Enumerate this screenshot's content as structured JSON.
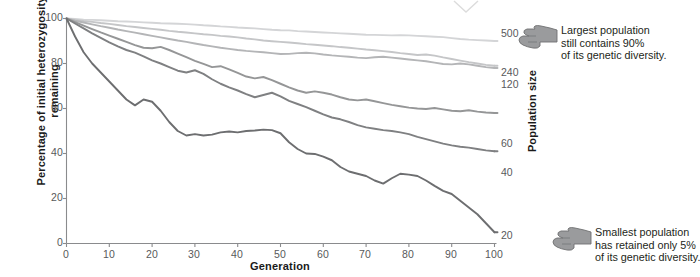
{
  "chart_data": {
    "type": "line",
    "title": "",
    "xlabel": "Generation",
    "ylabel": "Percentage of initial heterozygosity remaining",
    "right_axis_label": "Population size",
    "xlim": [
      0,
      100
    ],
    "ylim": [
      0,
      100
    ],
    "x_ticks": [
      "0",
      "10",
      "20",
      "30",
      "40",
      "50",
      "60",
      "70",
      "80",
      "90",
      "100"
    ],
    "y_ticks": [
      "0",
      "20",
      "40",
      "60",
      "80",
      "100"
    ],
    "grid": false,
    "legend_position": "right-end-labels",
    "series": [
      {
        "name": "500",
        "label": "500",
        "color": "#d4d5d7",
        "end_value": 90,
        "x": [
          0,
          2,
          4,
          6,
          8,
          10,
          12,
          14,
          16,
          18,
          20,
          22,
          24,
          26,
          28,
          30,
          32,
          34,
          36,
          38,
          40,
          42,
          44,
          46,
          48,
          50,
          52,
          54,
          56,
          58,
          60,
          62,
          64,
          66,
          68,
          70,
          72,
          74,
          76,
          78,
          80,
          82,
          84,
          86,
          88,
          90,
          92,
          94,
          96,
          98,
          100
        ],
        "values": [
          100,
          99.8,
          99.5,
          99.4,
          99.2,
          99.0,
          98.8,
          98.7,
          98.5,
          98.3,
          98.1,
          97.9,
          97.8,
          97.7,
          97.5,
          97.3,
          97.0,
          96.8,
          96.5,
          96.3,
          96.0,
          95.8,
          95.6,
          95.3,
          95.0,
          94.8,
          94.7,
          94.4,
          94.2,
          94.0,
          93.8,
          93.6,
          93.4,
          93.2,
          93.0,
          92.8,
          92.7,
          92.6,
          92.5,
          92.6,
          92.5,
          92.3,
          92.1,
          91.9,
          91.7,
          91.3,
          90.9,
          90.6,
          90.4,
          90.2,
          90.0
        ]
      },
      {
        "name": "240",
        "label": "240",
        "color": "#c5c6c8",
        "end_value": 79,
        "x": [
          0,
          2,
          4,
          6,
          8,
          10,
          12,
          14,
          16,
          18,
          20,
          22,
          24,
          26,
          28,
          30,
          32,
          34,
          36,
          38,
          40,
          42,
          44,
          46,
          48,
          50,
          52,
          54,
          56,
          58,
          60,
          62,
          64,
          66,
          68,
          70,
          72,
          74,
          76,
          78,
          80,
          82,
          84,
          86,
          88,
          90,
          92,
          94,
          96,
          98,
          100
        ],
        "values": [
          100,
          99.4,
          98.9,
          98.5,
          98.0,
          97.6,
          97.1,
          96.6,
          96.2,
          95.8,
          95.4,
          95.0,
          94.5,
          94.1,
          93.8,
          93.4,
          93.0,
          92.7,
          92.3,
          92.0,
          91.6,
          91.1,
          90.7,
          90.2,
          89.9,
          89.6,
          89.3,
          89.0,
          88.6,
          88.3,
          88.0,
          87.7,
          87.3,
          87.0,
          86.6,
          86.2,
          85.9,
          85.5,
          85.1,
          84.6,
          84.2,
          83.8,
          84.0,
          83.5,
          82.7,
          82.0,
          81.3,
          80.6,
          80.0,
          79.4,
          79.0
        ]
      },
      {
        "name": "120",
        "label": "120",
        "color": "#b4b5b7",
        "end_value": 78,
        "x": [
          0,
          2,
          4,
          6,
          8,
          10,
          12,
          14,
          16,
          18,
          20,
          22,
          24,
          26,
          28,
          30,
          32,
          34,
          36,
          38,
          40,
          42,
          44,
          46,
          48,
          50,
          52,
          54,
          56,
          58,
          60,
          62,
          64,
          66,
          68,
          70,
          72,
          74,
          76,
          78,
          80,
          82,
          84,
          86,
          88,
          90,
          92,
          94,
          96,
          98,
          100
        ],
        "values": [
          100,
          99.0,
          98.2,
          97.4,
          96.6,
          95.9,
          95.1,
          94.4,
          93.7,
          93.0,
          92.3,
          91.6,
          90.9,
          90.2,
          89.6,
          88.9,
          88.2,
          87.6,
          87.0,
          86.5,
          86.0,
          85.6,
          85.3,
          85.0,
          84.6,
          84.2,
          84.3,
          84.6,
          84.8,
          84.5,
          84.0,
          83.6,
          83.3,
          83.0,
          82.6,
          82.4,
          82.8,
          83.0,
          82.6,
          82.2,
          81.8,
          81.4,
          81.0,
          80.4,
          79.8,
          79.6,
          80.0,
          79.6,
          79.0,
          78.4,
          78.0
        ]
      },
      {
        "name": "60",
        "label": "60",
        "color": "#959697",
        "end_value": 58,
        "x": [
          0,
          2,
          4,
          6,
          8,
          10,
          12,
          14,
          16,
          18,
          20,
          22,
          24,
          26,
          28,
          30,
          32,
          34,
          36,
          38,
          40,
          42,
          44,
          46,
          48,
          50,
          52,
          54,
          56,
          58,
          60,
          62,
          64,
          66,
          68,
          70,
          72,
          74,
          76,
          78,
          80,
          82,
          84,
          86,
          88,
          90,
          92,
          94,
          96,
          98,
          100
        ],
        "values": [
          100,
          98.4,
          96.8,
          95.3,
          93.8,
          92.4,
          91.0,
          89.6,
          88.2,
          87.0,
          86.8,
          87.4,
          86.0,
          84.4,
          82.8,
          81.2,
          79.8,
          78.4,
          78.8,
          77.4,
          75.8,
          74.2,
          73.4,
          74.0,
          72.6,
          71.0,
          69.4,
          68.0,
          67.0,
          67.6,
          67.0,
          66.2,
          65.0,
          64.0,
          63.6,
          64.0,
          63.2,
          62.4,
          61.6,
          61.0,
          60.4,
          60.0,
          59.8,
          60.2,
          59.6,
          59.0,
          58.8,
          59.2,
          58.6,
          58.2,
          58.0
        ]
      },
      {
        "name": "40",
        "label": "40",
        "color": "#7f8082",
        "end_value": 41,
        "x": [
          0,
          2,
          4,
          6,
          8,
          10,
          12,
          14,
          16,
          18,
          20,
          22,
          24,
          26,
          28,
          30,
          32,
          34,
          36,
          38,
          40,
          42,
          44,
          46,
          48,
          50,
          52,
          54,
          56,
          58,
          60,
          62,
          64,
          66,
          68,
          70,
          72,
          74,
          76,
          78,
          80,
          82,
          84,
          86,
          88,
          90,
          92,
          94,
          96,
          98,
          100
        ],
        "values": [
          100,
          97.8,
          95.6,
          93.4,
          91.4,
          89.4,
          87.6,
          86.0,
          84.8,
          83.2,
          81.4,
          80.0,
          78.4,
          76.8,
          76.0,
          77.0,
          75.4,
          73.0,
          71.0,
          69.4,
          68.0,
          66.4,
          65.0,
          66.0,
          67.0,
          65.4,
          63.4,
          62.0,
          60.6,
          59.0,
          57.4,
          56.0,
          55.2,
          54.0,
          52.6,
          51.6,
          51.0,
          50.4,
          50.0,
          49.4,
          48.6,
          47.4,
          46.4,
          45.4,
          44.4,
          43.6,
          43.0,
          42.6,
          42.0,
          41.4,
          41.0
        ]
      },
      {
        "name": "20",
        "label": "20",
        "color": "#6d6e70",
        "end_value": 5,
        "x": [
          0,
          2,
          4,
          6,
          8,
          10,
          12,
          14,
          16,
          18,
          20,
          22,
          24,
          26,
          28,
          30,
          32,
          34,
          36,
          38,
          40,
          42,
          44,
          46,
          48,
          50,
          52,
          54,
          56,
          58,
          60,
          62,
          64,
          66,
          68,
          70,
          72,
          74,
          76,
          78,
          80,
          82,
          84,
          86,
          88,
          90,
          92,
          94,
          96,
          98,
          100
        ],
        "values": [
          100,
          92.0,
          85.0,
          80.0,
          76.0,
          72.0,
          68.0,
          64.0,
          61.4,
          64.0,
          63.0,
          59.0,
          54.0,
          50.0,
          48.0,
          48.6,
          48.0,
          48.4,
          49.4,
          49.8,
          49.4,
          50.0,
          50.2,
          50.6,
          50.4,
          49.0,
          45.0,
          42.0,
          40.0,
          39.8,
          38.6,
          37.0,
          34.0,
          32.0,
          31.0,
          30.0,
          28.0,
          26.6,
          29.0,
          31.0,
          30.6,
          30.0,
          28.0,
          25.6,
          23.4,
          22.0,
          19.0,
          16.0,
          13.0,
          9.0,
          5.0
        ]
      }
    ]
  },
  "annotations": {
    "top": {
      "icon": "pointing-hand-icon",
      "lines": [
        "Largest population",
        "still contains 90%",
        "of its genetic diversity."
      ]
    },
    "bottom": {
      "icon": "pointing-hand-icon",
      "lines": [
        "Smallest population",
        "has retained only 5%",
        "of its genetic diversity."
      ]
    }
  }
}
